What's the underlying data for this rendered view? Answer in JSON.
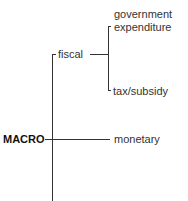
{
  "diagram": {
    "root": "MACRO",
    "branches": {
      "fiscal": "fiscal",
      "monetary": "monetary"
    },
    "fiscal_children": {
      "gov_line1": "government",
      "gov_line2": "expenditure",
      "tax": "tax/subsidy"
    }
  }
}
